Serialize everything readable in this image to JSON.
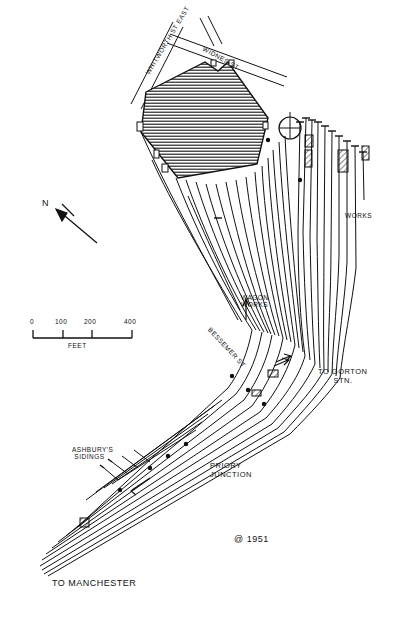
{
  "diagram": {
    "date_annotation": "@ 1951",
    "background_color": "#ffffff",
    "ink_color": "#111111"
  },
  "streets": [
    {
      "name": "street-whitworth",
      "label": "WHITWORTH ST EAST",
      "x": 152,
      "y": 62,
      "rotate": -58
    },
    {
      "name": "street-widnes",
      "label": "WIDNES ST",
      "x": 206,
      "y": 48,
      "rotate": 29
    }
  ],
  "place_labels": [
    {
      "name": "label-works",
      "label": "WORKS",
      "x": 345,
      "y": 215
    },
    {
      "name": "label-wagon-works",
      "label": "WAGON\nWORKS",
      "x": 241,
      "y": 298
    },
    {
      "name": "label-bessemer-st",
      "label": "BESSEMER ST",
      "x": 214,
      "y": 330,
      "rotate": 47
    },
    {
      "name": "label-to-gorton",
      "label": "TO GORTON\n      STN.",
      "x": 320,
      "y": 372
    },
    {
      "name": "label-ashburys-sidings",
      "label": "ASHBURY'S\n SIDINGS",
      "x": 74,
      "y": 450
    },
    {
      "name": "label-priory-junction",
      "label": "PRIORY\nJUNCTION",
      "x": 212,
      "y": 466
    },
    {
      "name": "label-to-manchester",
      "label": "TO MANCHESTER",
      "x": 52,
      "y": 583
    }
  ],
  "compass": {
    "name": "north-arrow",
    "letter": "N",
    "letter_x": 44,
    "letter_y": 203,
    "tail_x": 97,
    "tail_y": 243,
    "head_x": 58,
    "head_y": 212
  },
  "scale_bar": {
    "name": "scale-bar",
    "unit_label": "FEET",
    "ticks": [
      "0",
      "100",
      "200",
      "400"
    ],
    "tick_x": [
      33,
      63,
      92,
      132
    ],
    "baseline_y": 338,
    "tick_top_y": 330,
    "unit_x": 68,
    "unit_y": 344
  },
  "works_building": {
    "name": "main-works-building",
    "fill": "hatch-horizontal",
    "points": "146,92 205,62 218,71 228,62 268,118 257,164 178,178 141,132"
  },
  "turntable": {
    "name": "turntable",
    "cx": 290,
    "cy": 128,
    "r": 11
  },
  "small_buildings": [
    {
      "name": "building-block-a",
      "x": 305,
      "y": 135,
      "w": 8,
      "h": 12
    },
    {
      "name": "building-block-b",
      "x": 305,
      "y": 150,
      "w": 7,
      "h": 17
    },
    {
      "name": "building-block-c",
      "x": 338,
      "y": 150,
      "w": 10,
      "h": 22
    },
    {
      "name": "building-block-d",
      "x": 362,
      "y": 146,
      "w": 7,
      "h": 14
    }
  ],
  "legend_note": {
    "name": "date-stamp",
    "text": "@ 1951",
    "x": 234,
    "y": 539
  }
}
